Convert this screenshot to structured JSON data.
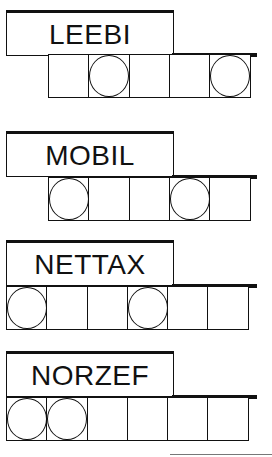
{
  "puzzles": [
    {
      "word": "LEEBI",
      "letter_count": 5,
      "circled_positions": [
        2,
        5
      ],
      "cells": [
        {
          "index": 1,
          "circled": false
        },
        {
          "index": 2,
          "circled": true
        },
        {
          "index": 3,
          "circled": false
        },
        {
          "index": 4,
          "circled": false
        },
        {
          "index": 5,
          "circled": true
        }
      ]
    },
    {
      "word": "MOBIL",
      "letter_count": 5,
      "circled_positions": [
        1,
        4
      ],
      "cells": [
        {
          "index": 1,
          "circled": true
        },
        {
          "index": 2,
          "circled": false
        },
        {
          "index": 3,
          "circled": false
        },
        {
          "index": 4,
          "circled": true
        },
        {
          "index": 5,
          "circled": false
        }
      ]
    },
    {
      "word": "NETTAX",
      "letter_count": 6,
      "circled_positions": [
        1,
        4
      ],
      "cells": [
        {
          "index": 1,
          "circled": true
        },
        {
          "index": 2,
          "circled": false
        },
        {
          "index": 3,
          "circled": false
        },
        {
          "index": 4,
          "circled": true
        },
        {
          "index": 5,
          "circled": false
        },
        {
          "index": 6,
          "circled": false
        }
      ]
    },
    {
      "word": "NORZEF",
      "letter_count": 6,
      "circled_positions": [
        1,
        2
      ],
      "cells": [
        {
          "index": 1,
          "circled": true
        },
        {
          "index": 2,
          "circled": true
        },
        {
          "index": 3,
          "circled": false
        },
        {
          "index": 4,
          "circled": false
        },
        {
          "index": 5,
          "circled": false
        },
        {
          "index": 6,
          "circled": false
        }
      ]
    }
  ],
  "colors": {
    "ink": "#111111",
    "background": "#ffffff",
    "rule": "#777777"
  }
}
